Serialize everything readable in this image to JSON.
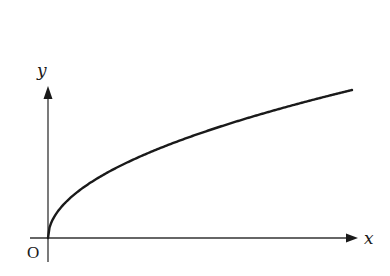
{
  "chart_data": {
    "type": "line",
    "title": "",
    "xlabel": "x",
    "ylabel": "y",
    "origin_label": "O",
    "function": "y = sqrt(x)",
    "series": [
      {
        "name": "curve",
        "x": [
          0,
          0.01,
          0.05,
          0.1,
          0.2,
          0.3,
          0.4,
          0.5,
          0.6,
          0.7,
          0.8,
          0.9,
          1.0
        ],
        "values": [
          0,
          0.1,
          0.224,
          0.316,
          0.447,
          0.548,
          0.632,
          0.707,
          0.775,
          0.837,
          0.894,
          0.949,
          1.0
        ]
      }
    ],
    "grid": false,
    "legend": "none",
    "axis_ticks": "none",
    "colors": {
      "line": "#1a1a1a",
      "axis": "#333333"
    }
  },
  "labels": {
    "x_axis": "x",
    "y_axis": "y",
    "origin": "O"
  }
}
